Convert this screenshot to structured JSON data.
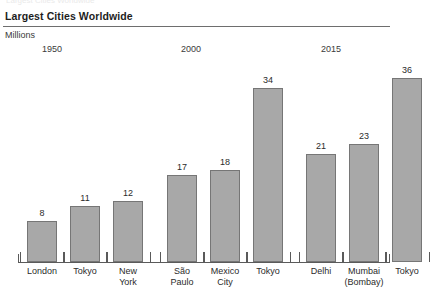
{
  "header": {
    "title": "Largest Cities Worldwide",
    "units": "Millions",
    "top_cropped_text": "Largest Cities Worldwide"
  },
  "chart_data": {
    "type": "bar",
    "title": "Largest Cities Worldwide",
    "subtitle": "Millions",
    "xlabel": "",
    "ylabel": "Millions",
    "ylim": [
      0,
      40
    ],
    "grid": false,
    "legend": false,
    "group_labels": [
      "1950",
      "2000",
      "2015"
    ],
    "categories": [
      "London",
      "Tokyo",
      "New York",
      "São Paulo",
      "Mexico City",
      "Tokyo",
      "Delhi",
      "Mumbai (Bombay)",
      "Tokyo"
    ],
    "values": [
      8,
      11,
      12,
      17,
      18,
      34,
      21,
      23,
      36
    ],
    "groups": [
      {
        "year": "1950",
        "bars": [
          {
            "label_line1": "London",
            "label_line2": "",
            "value": 8
          },
          {
            "label_line1": "Tokyo",
            "label_line2": "",
            "value": 11
          },
          {
            "label_line1": "New",
            "label_line2": "York",
            "value": 12
          }
        ]
      },
      {
        "year": "2000",
        "bars": [
          {
            "label_line1": "São",
            "label_line2": "Paulo",
            "value": 17
          },
          {
            "label_line1": "Mexico",
            "label_line2": "City",
            "value": 18
          },
          {
            "label_line1": "Tokyo",
            "label_line2": "",
            "value": 34
          }
        ]
      },
      {
        "year": "2015",
        "bars": [
          {
            "label_line1": "Delhi",
            "label_line2": "",
            "value": 21
          },
          {
            "label_line1": "Mumbai",
            "label_line2": "(Bombay)",
            "value": 23
          },
          {
            "label_line1": "Tokyo",
            "label_line2": "",
            "value": 36
          }
        ]
      }
    ],
    "colors": {
      "bar_fill": "#a8a8a8",
      "bar_border": "#767676",
      "axis": "#5a5a5a",
      "text": "#2b2b2b",
      "rule": "#6e6e6e",
      "background": "#ffffff"
    }
  }
}
